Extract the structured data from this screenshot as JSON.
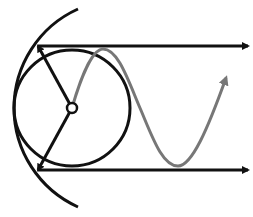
{
  "diagram": {
    "colors": {
      "background": "#ffffff",
      "stroke": "#111111",
      "wave": "#777777"
    },
    "circle": {
      "cx": 72,
      "cy": 108,
      "r": 58
    },
    "hub": {
      "cx": 72,
      "cy": 108,
      "r": 5
    },
    "outer_arc": {
      "d": "M78,9 A108.6,108.6 0 0 0 78,207"
    },
    "top_line": {
      "x1": 38,
      "y1": 46,
      "x2": 248,
      "y2": 46
    },
    "bottom_line": {
      "x1": 38,
      "y1": 170,
      "x2": 248,
      "y2": 170
    },
    "radius_up": {
      "x1": 72,
      "y1": 108,
      "x2": 38,
      "y2": 46
    },
    "radius_down": {
      "x1": 72,
      "y1": 108,
      "x2": 38,
      "y2": 170
    },
    "wave": {
      "d": "M72,108 C80,80 92,49 103,49 C118,49 128,80 140,108 C152,136 162,166 178,166 C192,166 208,128 226,78"
    }
  }
}
